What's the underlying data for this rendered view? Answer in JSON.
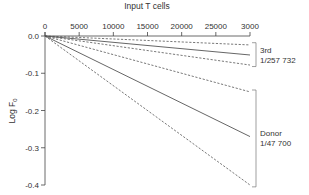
{
  "chart_data": {
    "type": "line",
    "title": "",
    "xlabel": "Input T cells",
    "ylabel": "Log F",
    "ylabel_subscript": "0",
    "xlim": [
      0,
      30000
    ],
    "ylim": [
      -0.4,
      0.0
    ],
    "x_ticks": [
      0,
      5000,
      10000,
      15000,
      20000,
      25000,
      30000
    ],
    "x_tick_labels": [
      "0",
      "5000",
      "10000",
      "15000",
      "20000",
      "25000",
      "3000"
    ],
    "y_ticks": [
      0.0,
      -0.1,
      -0.2,
      -0.3,
      -0.4
    ],
    "y_tick_labels": [
      "0.0",
      "-0.1",
      "-0.2",
      "-0.3",
      "-0.4"
    ],
    "x_axis_position": "top",
    "grid": false,
    "series": [
      {
        "name": "3rd upper 95% CI",
        "style": "dashed",
        "x": [
          0,
          30000
        ],
        "y": [
          0,
          -0.024
        ]
      },
      {
        "name": "3rd estimate",
        "style": "solid",
        "x": [
          0,
          30000
        ],
        "y": [
          0,
          -0.051
        ]
      },
      {
        "name": "3rd lower 95% CI",
        "style": "dashed",
        "x": [
          0,
          30000
        ],
        "y": [
          0,
          -0.078
        ]
      },
      {
        "name": "Donor upper 95% CI",
        "style": "dashed",
        "x": [
          0,
          30000
        ],
        "y": [
          0,
          -0.15
        ]
      },
      {
        "name": "Donor estimate",
        "style": "solid",
        "x": [
          0,
          30000
        ],
        "y": [
          0,
          -0.27
        ]
      },
      {
        "name": "Donor lower 95% CI",
        "style": "dashed",
        "x": [
          0,
          30000
        ],
        "y": [
          0,
          -0.4
        ]
      }
    ],
    "annotations": [
      {
        "group": "3rd",
        "lines": [
          "3rd",
          "1/257 732"
        ],
        "y_range": [
          -0.018,
          -0.082
        ]
      },
      {
        "group": "Donor",
        "lines": [
          "Donor",
          "1/47 700"
        ],
        "y_range": [
          -0.145,
          -0.405
        ]
      }
    ],
    "colors": {
      "line": "#555555",
      "axis": "#444444",
      "text": "#333333"
    }
  }
}
